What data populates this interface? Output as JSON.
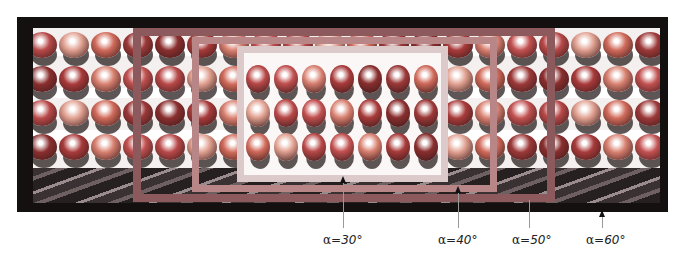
{
  "figure": {
    "frames": [
      {
        "id": "alpha-60",
        "label": "α=60°",
        "color": "#141010"
      },
      {
        "id": "alpha-50",
        "label": "α=50°",
        "color": "#8c5a5c"
      },
      {
        "id": "alpha-40",
        "label": "α=40°",
        "color": "#b98688"
      },
      {
        "id": "alpha-30",
        "label": "α=30°",
        "color": "#dcc9c9"
      }
    ],
    "labels": {
      "a30": {
        "symbol": "α",
        "value": "=30°"
      },
      "a40": {
        "symbol": "α",
        "value": "=40°"
      },
      "a50": {
        "symbol": "α",
        "value": "=50°"
      },
      "a60": {
        "symbol": "α",
        "value": "=60°"
      }
    }
  }
}
